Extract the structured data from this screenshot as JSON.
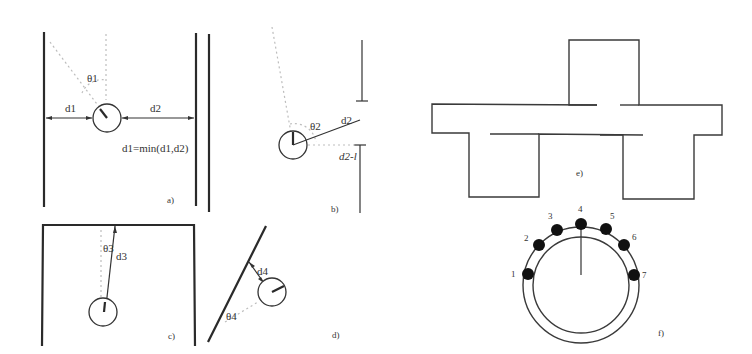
{
  "figure": {
    "panels": [
      {
        "id": "a",
        "caption": "a)",
        "labels": {
          "left_distance": "d1",
          "right_distance": "d2",
          "angle": "θ1",
          "formula": "d1=min(d1,d2)"
        }
      },
      {
        "id": "b",
        "caption": "b)",
        "labels": {
          "angle": "θ2",
          "distance": "d2",
          "gap_distance": "d2-l"
        }
      },
      {
        "id": "c",
        "caption": "c)",
        "labels": {
          "angle": "θ3",
          "distance": "d3"
        }
      },
      {
        "id": "d",
        "caption": "d)",
        "labels": {
          "angle": "θ4",
          "distance": "d4"
        }
      },
      {
        "id": "e",
        "caption": "e)"
      },
      {
        "id": "f",
        "caption": "f)",
        "sensor_labels": [
          "1",
          "2",
          "3",
          "4",
          "5",
          "6",
          "7"
        ]
      }
    ]
  },
  "colors": {
    "line": "#2a2a2a",
    "dotted": "#bdbdbd",
    "sensor": "#111111",
    "background": "#ffffff"
  }
}
